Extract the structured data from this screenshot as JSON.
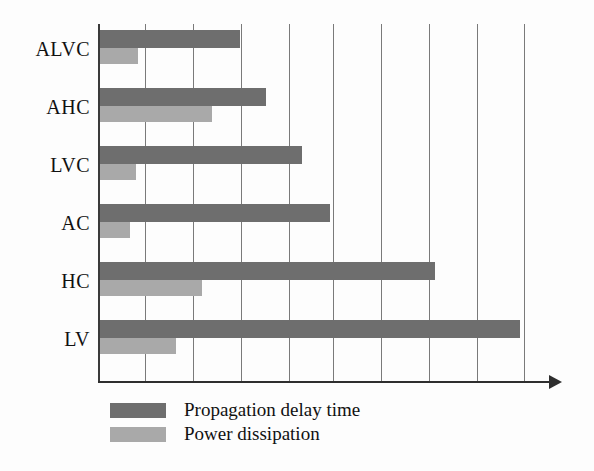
{
  "chart_data": {
    "type": "bar",
    "orientation": "horizontal",
    "title": "",
    "xlabel": "",
    "ylabel": "",
    "categories": [
      "ALVC",
      "AHC",
      "LVC",
      "AC",
      "HC",
      "LV"
    ],
    "series": [
      {
        "name": "Propagation delay time",
        "color": "#6e6e6e",
        "values": [
          3.0,
          3.55,
          4.3,
          4.9,
          7.1,
          8.9
        ]
      },
      {
        "name": "Power dissipation",
        "color": "#a9a9a9",
        "values": [
          0.85,
          2.4,
          0.8,
          0.67,
          2.2,
          1.65
        ]
      }
    ],
    "xlim": [
      0,
      9
    ],
    "xticks": [
      0,
      1,
      2,
      3,
      4,
      5,
      6,
      7,
      8,
      9
    ],
    "xtick_labels": [
      "",
      "",
      "",
      "",
      "",
      "",
      "",
      "",
      "",
      ""
    ],
    "grid": "vertical-only",
    "legend_position": "below-left",
    "axis_arrow": true
  },
  "axis": {
    "categories": [
      {
        "label": "ALVC"
      },
      {
        "label": "AHC"
      },
      {
        "label": "LVC"
      },
      {
        "label": "AC"
      },
      {
        "label": "HC"
      },
      {
        "label": "LV"
      }
    ]
  },
  "legend": {
    "items": [
      {
        "label": "Propagation delay time",
        "color": "#6e6e6e"
      },
      {
        "label": "Power dissipation",
        "color": "#a9a9a9"
      }
    ]
  }
}
